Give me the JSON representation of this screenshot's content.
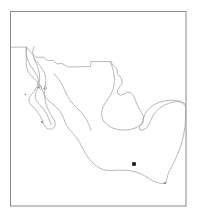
{
  "figure": {
    "type": "locator-map",
    "title": "",
    "caption": "",
    "background_color": "#ffffff",
    "width": 197,
    "height": 223
  },
  "frame": {
    "name": "map-border",
    "x": 10.5,
    "y": 11.5,
    "width": 175.5,
    "height": 194.5,
    "stroke_color": "#8a8a8a",
    "stroke_width": 1.0
  },
  "region": {
    "name": "Mexico",
    "outline_color": "#9a9a9a",
    "outline_width": 0.7,
    "fill_color": "none"
  },
  "chart_data": {
    "type": "map",
    "title": "",
    "xlabel": "",
    "ylabel": "",
    "projection": "plate-carree",
    "extent_note": "Mexico and adjacent waters",
    "markers": [
      {
        "label": "",
        "name": "locality-marker-central-mexico",
        "x": 134,
        "y": 164,
        "size": 3.6,
        "shape": "square",
        "color": "#111111"
      }
    ],
    "minor_marks": [
      {
        "name": "island-mark-1",
        "x": 25.5,
        "y": 94.5,
        "size": 1.3,
        "color": "#7a7a7a"
      },
      {
        "name": "island-mark-2",
        "x": 38.5,
        "y": 87.5,
        "size": 1.3,
        "color": "#6f6f6f"
      },
      {
        "name": "island-mark-3",
        "x": 44.0,
        "y": 88.5,
        "size": 1.2,
        "color": "#7a7a7a"
      },
      {
        "name": "island-mark-4",
        "x": 42.0,
        "y": 122.0,
        "size": 1.5,
        "color": "#5a5a5a"
      },
      {
        "name": "coast-mark-south",
        "x": 165.0,
        "y": 183.0,
        "size": 1.6,
        "color": "#6a6a6a"
      }
    ],
    "legend": [],
    "gridlines": false,
    "axes_visible": false
  },
  "paths": {
    "mainland_outline": "M 11.2,47.2 L 26.6,47.0 L 31.6,53.2 L 36.0,57.2 L 43.4,57.0 L 47.4,60.4 L 53.0,60.2 L 56.6,63.6 L 62.0,63.4 L 67.8,66.8 L 77.0,66.6 L 85.6,66.4 L 90.4,66.5 L 90.6,61.6 L 101.0,61.5 L 110.4,61.6 L 113.0,65.2 L 116.6,68.6 L 117.4,73.6 L 121.4,78.6 L 122.0,83.6 L 119.0,87.0 L 117.2,90.2 L 117.6,93.6 L 120.4,95.0 L 124.0,93.8 L 127.2,92.0 L 130.6,92.6 L 133.2,95.6 L 135.0,99.4 L 136.8,104.0 L 139.0,108.6 L 141.4,112.6 L 143.2,116.4 L 143.0,120.4 L 141.2,123.6 L 139.0,126.6 L 139.6,129.6 L 142.6,129.8 L 146.0,128.0 L 148.6,124.6 L 150.4,120.4 L 152.6,115.6 L 155.6,111.6 L 159.4,108.0 L 163.6,105.2 L 168.2,103.2 L 172.6,102.0 L 176.4,101.4 L 179.6,101.6 L 182.2,102.8 L 184.0,104.6 L 185.6,106.4 L 185.8,112.0 L 185.6,119.0 L 185.0,126.0 L 184.0,132.6 L 182.6,139.0 L 181.0,145.0 L 179.0,150.6 L 177.0,155.6 L 175.0,160.0 L 173.2,163.6 L 171.4,167.0 L 169.6,170.4 L 168.0,174.0 L 167.0,177.6 L 166.4,180.8 L 166.0,183.0 L 163.0,183.4 L 159.6,183.0 L 156.0,182.0 L 152.4,180.4 L 149.0,178.4 L 145.6,176.2 L 142.0,174.2 L 138.4,172.6 L 134.6,171.4 L 130.6,170.6 L 126.6,170.2 L 122.6,170.0 L 118.6,170.0 L 114.6,170.2 L 110.6,170.4 L 106.8,170.2 L 103.2,169.4 L 100.0,168.0 L 97.0,166.2 L 94.2,164.0 L 91.6,161.4 L 89.2,158.6 L 87.0,155.6 L 85.0,152.4 L 83.2,149.0 L 81.4,145.6 L 79.6,142.2 L 77.6,139.0 L 75.4,136.0 L 73.0,133.2 L 70.6,130.6 L 68.4,128.0 L 66.6,125.2 L 65.2,122.2 L 64.0,119.0 L 62.6,115.8 L 61.0,112.8 L 59.0,110.0 L 56.8,107.6 L 54.4,105.4 L 52.0,103.4 L 49.6,101.4 L 47.4,99.2 L 45.6,96.8 L 44.2,94.2 L 43.0,91.4 L 41.8,88.6 L 40.4,85.8 L 38.6,83.2 L 36.6,80.8 L 34.4,78.6 L 32.2,76.6 L 30.2,74.4 L 28.6,72.0 L 27.4,69.4 L 26.6,66.6 L 26.0,63.8",
    "yucatan_note": "Yucatan lobe contained in mainland path via east bulge",
    "baja_outline": "M 26.2,47.4 L 26.0,53.0 L 27.0,58.2 L 28.8,62.8 L 31.0,66.8 L 33.4,70.4 L 35.6,73.6 L 37.2,76.6 L 38.0,79.6 L 38.0,82.6 L 37.2,85.4 L 36.0,88.0 L 34.6,90.4 L 33.0,92.6 L 31.4,94.6 L 30.0,96.6 L 29.0,98.6 L 28.6,100.6 L 29.0,102.6 L 30.2,104.4 L 32.0,106.2 L 34.0,108.2 L 36.0,110.4 L 37.8,112.8 L 39.4,115.4 L 40.8,118.0 L 42.0,120.6 L 43.0,123.0 L 44.0,125.2 L 45.2,127.0 L 46.8,128.4 L 48.6,129.2 L 50.4,129.4 L 52.2,129.0 L 53.6,128.0 L 54.6,126.6 L 55.0,124.8 L 54.8,122.8 L 54.0,120.6 L 52.8,118.4 L 51.4,116.0 L 50.0,113.6 L 48.6,111.0 L 47.4,108.4 L 46.4,105.6 L 45.6,102.8 L 45.0,100.0 L 44.6,97.2 L 44.4,94.4 L 44.4,91.6 L 44.6,88.8 L 45.0,86.0 L 45.4,83.2 L 45.6,80.4 L 45.4,77.6 L 44.8,74.8 L 43.8,72.2 L 42.6,69.8 L 41.2,67.6 L 39.6,65.6 L 38.0,63.8 L 36.4,62.0 L 35.0,60.2 L 33.8,58.2 L 33.0,56.0 L 32.6,53.8 L 32.6,51.4 L 33.0,49.0 L 33.6,47.2",
    "baja_inner_gulf": "M 34.0,61.0 L 35.8,64.4 L 37.4,68.0 L 38.6,71.6 L 39.4,75.2 L 39.8,78.8 L 39.8,82.2 L 39.4,85.4 L 38.6,88.4 L 37.6,91.2 L 36.6,93.8 L 35.8,96.2 L 35.4,98.4 L 35.6,100.6 L 36.4,102.6 L 37.8,104.6 L 39.6,106.6 L 41.6,108.8 L 43.6,111.2 L 45.4,113.8 L 47.0,116.6 L 48.4,119.4 L 49.6,122.2 L 50.6,124.8 L 51.4,127.0",
    "gulf_coast_mainland": "M 54.4,73.6 L 57.0,76.4 L 59.4,79.4 L 61.4,82.6 L 63.2,86.0 L 64.8,89.4 L 66.4,92.8 L 68.0,96.0 L 69.8,99.0 L 71.8,101.8 L 74.0,104.4 L 76.4,106.8 L 78.8,109.2 L 81.2,111.6 L 83.4,114.2 L 85.4,117.0 L 87.2,120.0 L 88.8,123.2 L 90.2,126.4 L 91.4,129.8"
  }
}
